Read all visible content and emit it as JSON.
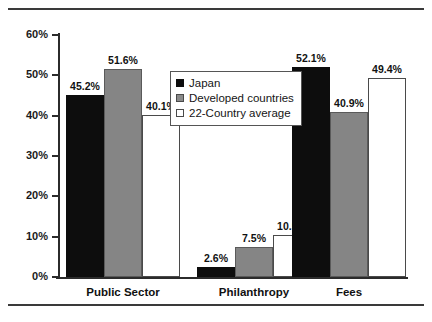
{
  "chart_data": {
    "type": "bar",
    "title": "",
    "subtitle": "",
    "xlabel": "",
    "ylabel": "",
    "categories": [
      "Public Sector",
      "Philanthropy",
      "Fees"
    ],
    "series": [
      {
        "name": "Japan",
        "color": "#0d0d0d",
        "values": [
          45.2,
          51.6,
          52.1
        ],
        "labels": [
          "45.2%",
          "51.6%",
          "52.1%"
        ]
      },
      {
        "name": "Developed countries",
        "color": "#858585",
        "values": [
          51.6,
          7.5,
          40.9
        ],
        "labels": [
          "51.6%",
          "7.5%",
          "40.9%"
        ]
      },
      {
        "name": "22-Country average",
        "color": "#ffffff",
        "values": [
          40.1,
          10.5,
          49.4
        ],
        "labels": [
          "40.1%",
          "10.5%",
          "49.4%"
        ]
      }
    ],
    "groups": [
      {
        "category": "Public Sector",
        "bars": [
          {
            "series": "Japan",
            "value": 45.2,
            "label": "45.2%"
          },
          {
            "series": "Developed countries",
            "value": 51.6,
            "label": "51.6%"
          },
          {
            "series": "22-Country average",
            "value": 40.1,
            "label": "40.1%"
          }
        ]
      },
      {
        "category": "Philanthropy",
        "bars": [
          {
            "series": "Japan",
            "value": 2.6,
            "label": "2.6%"
          },
          {
            "series": "Developed countries",
            "value": 7.5,
            "label": "7.5%"
          },
          {
            "series": "22-Country average",
            "value": 10.5,
            "label": "10.5%"
          }
        ]
      },
      {
        "category": "Fees",
        "bars": [
          {
            "series": "Japan",
            "value": 52.1,
            "label": "52.1%"
          },
          {
            "series": "Developed countries",
            "value": 40.9,
            "label": "40.9%"
          },
          {
            "series": "22-Country average",
            "value": 49.4,
            "label": "49.4%"
          }
        ]
      }
    ],
    "ylim": [
      0,
      60
    ],
    "ytick_values": [
      0,
      10,
      20,
      30,
      40,
      50,
      60
    ],
    "ytick_labels": [
      "0%",
      "10%",
      "20%",
      "30%",
      "40%",
      "50%",
      "60%"
    ],
    "grid": false,
    "legend": {
      "position": "inside-upper-center",
      "entries": [
        {
          "label": "Japan",
          "swatch": "japan"
        },
        {
          "label": "Developed countries",
          "swatch": "developed"
        },
        {
          "label": "22-Country average",
          "swatch": "average"
        }
      ]
    }
  }
}
